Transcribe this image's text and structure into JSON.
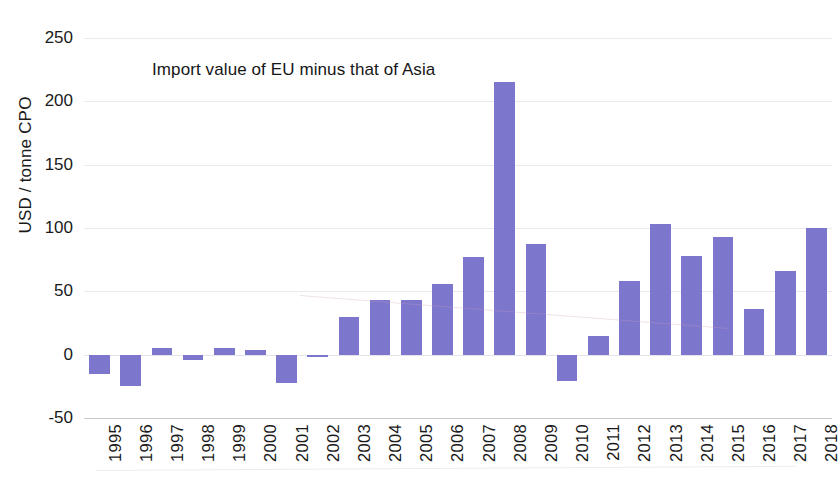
{
  "chart_data": {
    "type": "bar",
    "title": "Import value of EU minus that of Asia",
    "xlabel": "",
    "ylabel": "USD / tonne CPO",
    "ylim": [
      -50,
      250
    ],
    "yticks": [
      250,
      200,
      150,
      100,
      50,
      0,
      -50
    ],
    "ytick_labels": [
      "250",
      "200",
      "150",
      "100",
      "50",
      "0",
      "-50"
    ],
    "grid": true,
    "legend": "none",
    "bar_color": "#7d76cd",
    "categories": [
      "1995",
      "1996",
      "1997",
      "1998",
      "1999",
      "2000",
      "2001",
      "2002",
      "2003",
      "2004",
      "2005",
      "2006",
      "2007",
      "2008",
      "2009",
      "2010",
      "2011",
      "2012",
      "2013",
      "2014",
      "2015",
      "2016",
      "2017",
      "2018"
    ],
    "values": [
      -15,
      -25,
      5,
      -4,
      5,
      4,
      -22,
      -2,
      30,
      43,
      43,
      56,
      77,
      215,
      87,
      -21,
      15,
      58,
      103,
      78,
      93,
      36,
      66,
      100
    ]
  }
}
